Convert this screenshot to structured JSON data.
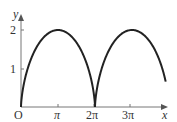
{
  "chart_data": {
    "type": "line",
    "title": "",
    "xlabel": "x",
    "ylabel": "y",
    "origin_label": "O",
    "x_ticks": [
      "π",
      "2π",
      "3π"
    ],
    "x_tick_values": [
      3.1416,
      6.2832,
      9.4248
    ],
    "y_ticks": [
      "1",
      "2"
    ],
    "y_tick_values": [
      1,
      2
    ],
    "xlim": [
      0,
      12.3
    ],
    "ylim": [
      0,
      2.2
    ],
    "grid": false,
    "series": [
      {
        "name": "cycloid x = t - sin t, y = 1 - cos t",
        "x": [
          0,
          0.21,
          1.57,
          3.14,
          4.71,
          6.07,
          6.28,
          6.49,
          7.85,
          9.42,
          11.0,
          12.1
        ],
        "y": [
          0,
          0.3,
          1.0,
          2.0,
          1.0,
          0.3,
          0,
          0.3,
          1.0,
          2.0,
          1.0,
          0.4
        ]
      }
    ]
  }
}
